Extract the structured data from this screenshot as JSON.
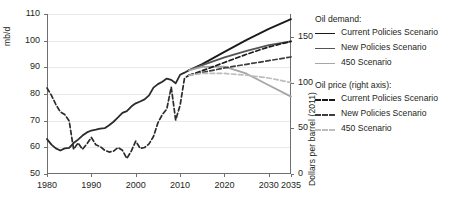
{
  "chart_data": {
    "type": "line",
    "title": "",
    "xlabel": "",
    "ylabel_left": "mb/d",
    "ylabel_right": "Dollars per barrel (2011)",
    "grid": true,
    "legend_position": "right",
    "xlim": [
      1980,
      2035
    ],
    "xticks": [
      1980,
      1990,
      2000,
      2010,
      2020,
      2030,
      2035
    ],
    "xtick_labels": [
      "1980",
      "1990",
      "2000",
      "2010",
      "2020",
      "2030",
      "2035"
    ],
    "ylim_left": [
      50,
      110
    ],
    "yticks_left": [
      50,
      60,
      70,
      80,
      90,
      100,
      110
    ],
    "ytick_labels_left": [
      "50",
      "60",
      "70",
      "80",
      "90",
      "100",
      "110"
    ],
    "ylim_right": [
      0,
      175
    ],
    "yticks_right": [
      0,
      50,
      100,
      150
    ],
    "ytick_labels_right": [
      "0",
      "50",
      "100",
      "150"
    ],
    "series": [
      {
        "name": "Oil demand history",
        "axis": "left",
        "style": "solid",
        "color": "#2b2b2b",
        "width": 1.8,
        "x": [
          1980,
          1981,
          1982,
          1983,
          1984,
          1985,
          1986,
          1987,
          1988,
          1989,
          1990,
          1991,
          1992,
          1993,
          1994,
          1995,
          1996,
          1997,
          1998,
          1999,
          2000,
          2001,
          2002,
          2003,
          2004,
          2005,
          2006,
          2007,
          2008,
          2009,
          2010,
          2011,
          2012
        ],
        "values": [
          63.1,
          61.0,
          59.6,
          58.8,
          59.6,
          59.8,
          61.6,
          62.9,
          64.4,
          65.6,
          66.3,
          66.6,
          67.0,
          67.2,
          68.3,
          69.6,
          71.2,
          72.9,
          73.6,
          75.3,
          76.5,
          77.2,
          78.0,
          79.5,
          82.4,
          83.7,
          84.6,
          85.8,
          85.3,
          84.0,
          87.2,
          88.0,
          88.9
        ]
      },
      {
        "name": "Current Policies Scenario",
        "axis": "left",
        "style": "solid",
        "color": "#1a1a1a",
        "width": 1.8,
        "x": [
          2012,
          2015,
          2020,
          2025,
          2030,
          2035
        ],
        "values": [
          88.9,
          91.2,
          95.8,
          100.3,
          104.4,
          108.1
        ]
      },
      {
        "name": "New Policies Scenario",
        "axis": "left",
        "style": "solid",
        "color": "#545454",
        "width": 1.8,
        "x": [
          2012,
          2015,
          2020,
          2025,
          2030,
          2035
        ],
        "values": [
          88.9,
          90.8,
          93.7,
          96.2,
          98.3,
          99.7
        ]
      },
      {
        "name": "450 Scenario",
        "axis": "left",
        "style": "solid",
        "color": "#a6a6a6",
        "width": 1.8,
        "x": [
          2012,
          2015,
          2020,
          2025,
          2030,
          2035
        ],
        "values": [
          88.9,
          90.2,
          90.3,
          87.6,
          83.3,
          79.0
        ]
      },
      {
        "name": "Oil price history",
        "axis": "right",
        "style": "dashed",
        "color": "#2b2b2b",
        "width": 1.7,
        "x": [
          1980,
          1981,
          1982,
          1983,
          1984,
          1985,
          1986,
          1987,
          1988,
          1989,
          1990,
          1991,
          1992,
          1993,
          1994,
          1995,
          1996,
          1997,
          1998,
          1999,
          2000,
          2001,
          2002,
          2003,
          2004,
          2005,
          2006,
          2007,
          2008,
          2009,
          2010,
          2011,
          2012
        ],
        "values": [
          94,
          86,
          76,
          68,
          65,
          58,
          27,
          34,
          27,
          33,
          40,
          32,
          30,
          26,
          24,
          25,
          29,
          26,
          17,
          25,
          36,
          28,
          29,
          33,
          41,
          56,
          65,
          71,
          95,
          59,
          75,
          105,
          108
        ]
      },
      {
        "name": "Current Policies Scenario",
        "axis": "right",
        "style": "dashed",
        "color": "#1a1a1a",
        "width": 1.7,
        "x": [
          2012,
          2015,
          2020,
          2025,
          2030,
          2035
        ],
        "values": [
          108,
          113,
          122,
          131,
          139,
          145
        ]
      },
      {
        "name": "New Policies Scenario",
        "axis": "right",
        "style": "dashed",
        "color": "#3d3d3d",
        "width": 1.7,
        "x": [
          2012,
          2015,
          2020,
          2025,
          2030,
          2035
        ],
        "values": [
          108,
          111,
          116,
          120,
          124,
          128
        ]
      },
      {
        "name": "450 Scenario",
        "axis": "right",
        "style": "dashed",
        "color": "#bdbdbd",
        "width": 1.7,
        "x": [
          2012,
          2015,
          2020,
          2025,
          2030,
          2035
        ],
        "values": [
          108,
          110,
          110,
          108,
          105,
          100
        ]
      }
    ]
  },
  "axes": {
    "left_title": "mb/d",
    "right_title": "Dollars per barrel (2011)",
    "left_ticks": [
      "110",
      "100",
      "90",
      "80",
      "70",
      "60",
      "50"
    ],
    "right_ticks": [
      "150",
      "100",
      "50",
      "0"
    ],
    "x_ticks": [
      "1980",
      "1990",
      "2000",
      "2010",
      "2020",
      "2030",
      "2035"
    ]
  },
  "legend": {
    "demand_heading": "Oil demand:",
    "price_heading": "Oil price (right axis):",
    "demand_items": [
      {
        "label": "Current Policies Scenario",
        "color": "#1a1a1a",
        "style": "solid"
      },
      {
        "label": "New Policies Scenario",
        "color": "#545454",
        "style": "solid"
      },
      {
        "label": "450 Scenario",
        "color": "#a6a6a6",
        "style": "solid"
      }
    ],
    "price_items": [
      {
        "label": "Current Policies Scenario",
        "color": "#1a1a1a",
        "style": "dashed"
      },
      {
        "label": "New Policies Scenario",
        "color": "#3d3d3d",
        "style": "dashed"
      },
      {
        "label": "450 Scenario",
        "color": "#bdbdbd",
        "style": "dashed"
      }
    ]
  }
}
